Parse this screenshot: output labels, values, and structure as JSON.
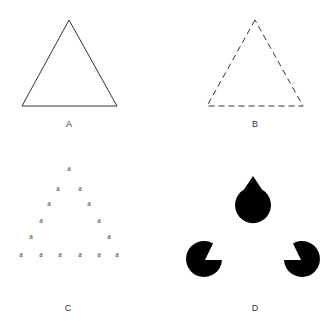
{
  "panels": [
    {
      "id": "A",
      "label": "A",
      "description": "solid triangle outline"
    },
    {
      "id": "B",
      "label": "B",
      "description": "dashed triangle outline"
    },
    {
      "id": "C",
      "label": "C",
      "description": "triangle formed by letters",
      "letter": "a"
    },
    {
      "id": "D",
      "label": "D",
      "description": "illusory (Kanizsa) triangle formed by three pac-man shapes"
    }
  ],
  "colors": {
    "stroke": "#333333",
    "fill": "#000000",
    "background": "#ffffff"
  }
}
